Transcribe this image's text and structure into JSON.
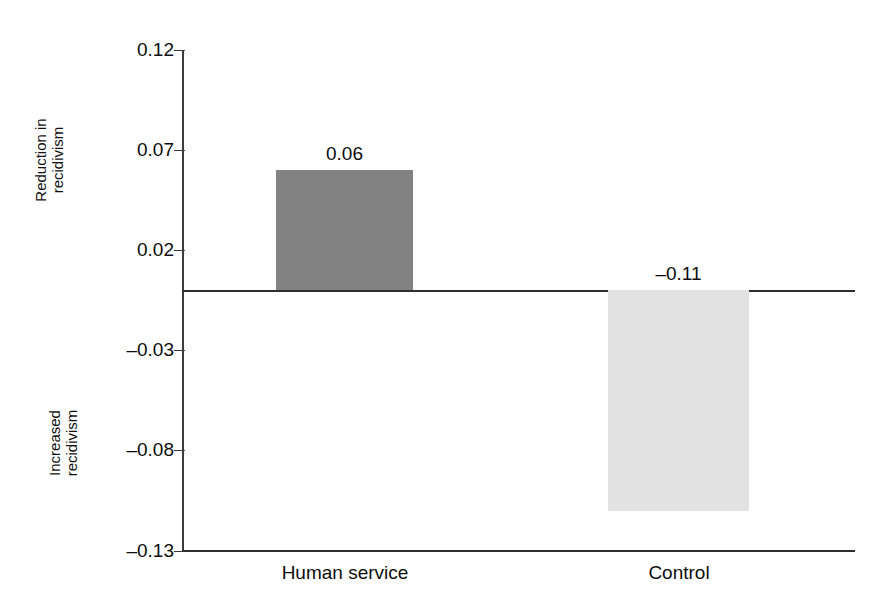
{
  "chart_data": {
    "type": "bar",
    "title": "",
    "subtitle": "",
    "xlabel": "",
    "ylabel": "Reduction in recidivism / Increased recidivism",
    "categories": [
      "Human service",
      "Control"
    ],
    "values": [
      0.06,
      -0.11
    ],
    "value_labels": [
      "0.06",
      "–0.11"
    ],
    "ylim": [
      -0.13,
      0.12
    ],
    "y_ticks": [
      0.12,
      0.07,
      0.02,
      -0.03,
      -0.08,
      -0.13
    ],
    "y_tick_labels": [
      "0.12",
      "0.07",
      "0.02",
      "–0.03",
      "–0.08",
      "–0.13"
    ],
    "grid": false,
    "legend": "none",
    "zero_reference_line": 0,
    "bar_colors": [
      "#828282",
      "#e2e2e2"
    ],
    "axis_group_labels": {
      "positive": [
        "Reduction in",
        "recidivism"
      ],
      "negative": [
        "Increased",
        "recidivism"
      ]
    }
  },
  "axis": {
    "positive_label_line1": "Reduction in",
    "positive_label_line2": "recidivism",
    "negative_label_line1": "Increased",
    "negative_label_line2": "recidivism",
    "ticks": [
      {
        "label": "0.12"
      },
      {
        "label": "0.07"
      },
      {
        "label": "0.02"
      },
      {
        "label": "–0.03"
      },
      {
        "label": "–0.08"
      },
      {
        "label": "–0.13"
      }
    ]
  },
  "bars": [
    {
      "category": "Human service",
      "value_label": "0.06",
      "color": "#828282"
    },
    {
      "category": "Control",
      "value_label": "–0.11",
      "color": "#e2e2e2"
    }
  ]
}
